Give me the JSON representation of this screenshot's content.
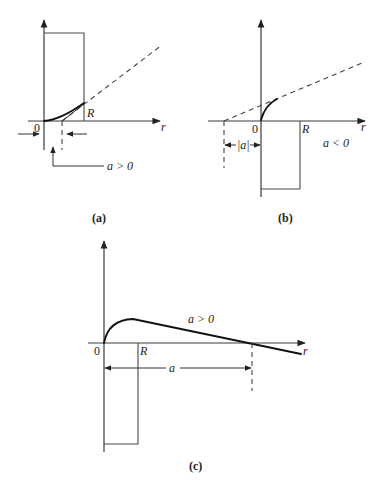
{
  "figure": {
    "panel_a": {
      "caption": "(a)",
      "axis_label_r": "r",
      "origin_label": "0",
      "R_label": "R",
      "condition_label": "a > 0"
    },
    "panel_b": {
      "caption": "(b)",
      "axis_label_r": "r",
      "origin_label": "0",
      "R_label": "R",
      "abs_a_label": "|a|",
      "condition_label": "a < 0"
    },
    "panel_c": {
      "caption": "(c)",
      "axis_label_r": "r",
      "origin_label": "0",
      "R_label": "R",
      "a_label": "a",
      "condition_label": "a > 0"
    }
  },
  "colors": {
    "line": "#111111",
    "axis": "#3a3a3a",
    "background": "#ffffff"
  }
}
